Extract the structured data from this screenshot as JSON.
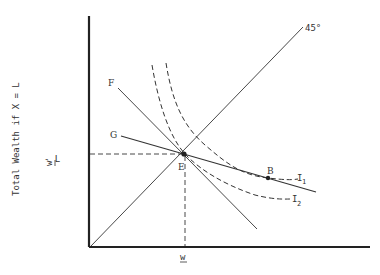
{
  "diagram": {
    "y_axis_label": "Total Wealth if X = L",
    "y_tick_label": {
      "w": "w",
      "rest": " - L"
    },
    "x_tick_label": "w",
    "angle_label": "45°",
    "line_labels": {
      "F": "F",
      "G": "G"
    },
    "point_labels": {
      "E": "E",
      "B": "B"
    },
    "curve_labels": {
      "I1": "I",
      "I1_sub": "1",
      "I2": "I",
      "I2_sub": "2"
    },
    "colors": {
      "line": "#333333",
      "axis": "#222222",
      "background": "#ffffff"
    }
  }
}
